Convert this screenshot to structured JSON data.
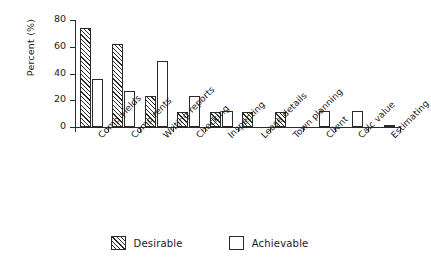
{
  "chart_data": {
    "type": "bar",
    "title": "",
    "xlabel": "",
    "ylabel": "Percent (%)",
    "ylim": [
      0,
      80
    ],
    "yticks": [
      0,
      20,
      40,
      60,
      80
    ],
    "grid": false,
    "legend_position": "bottom-center",
    "categories": [
      "Comp yields",
      "Comp rents",
      "Writing reports",
      "Checking",
      "Inspecting",
      "Lease details",
      "Town planning",
      "Client",
      "Calc value",
      "Estimating"
    ],
    "series": [
      {
        "name": "Desirable",
        "fill": "diagonal-hatch",
        "values": [
          74,
          62,
          23,
          11,
          11,
          11,
          11,
          0,
          0,
          0
        ]
      },
      {
        "name": "Achievable",
        "fill": "white",
        "values": [
          36,
          27,
          49,
          23,
          12,
          0,
          0,
          12,
          12,
          1
        ]
      }
    ]
  },
  "axes": {
    "y_title": "Percent (%)",
    "y_tick_labels": [
      "0",
      "20",
      "40",
      "60",
      "80"
    ]
  },
  "legend": {
    "items": [
      {
        "label": "Desirable",
        "swatch": "hatched-square-icon"
      },
      {
        "label": "Achievable",
        "swatch": "empty-square-icon"
      }
    ]
  },
  "colors": {
    "ink": "#2b2b2b",
    "background": "#ffffff"
  }
}
